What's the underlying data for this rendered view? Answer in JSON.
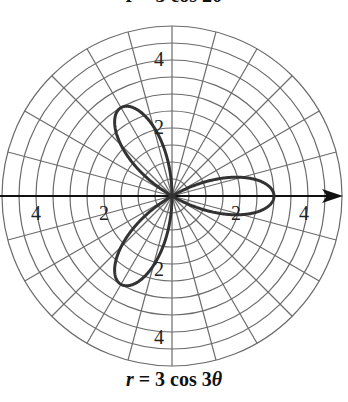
{
  "chart_data": {
    "type": "polar-line",
    "title_top": "r = 3 cos 2θ",
    "title": "r = 3 cos 3θ",
    "equation": {
      "r_var": "r",
      "rest": " = 3 cos 3",
      "theta": "θ"
    },
    "function": "r = 3*cos(3*theta)",
    "amplitude": 3,
    "petals": 3,
    "petal_angles_deg": [
      0,
      120,
      240
    ],
    "r_max": 5,
    "ring_step": 0.5,
    "spoke_step_deg": 15,
    "axis_tick_labels": {
      "x_positive": [
        "2",
        "4"
      ],
      "x_negative": [
        "2",
        "4"
      ],
      "y_positive": [
        "2",
        "4"
      ],
      "y_negative": [
        "2",
        "4"
      ]
    },
    "grid": true,
    "colors": {
      "grid": "#6b6b6b",
      "axis": "#111111",
      "curve": "#333333"
    }
  }
}
